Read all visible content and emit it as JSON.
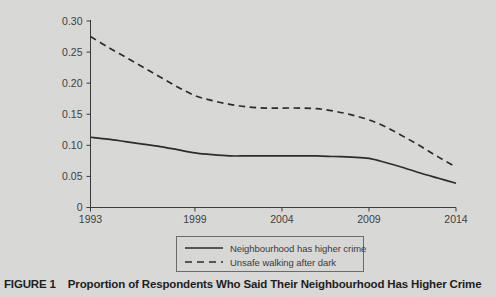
{
  "caption": {
    "figure_number": "FIGURE 1",
    "title": "Proportion of Respondents Who Said Their Neighbourhood Has Higher Crime"
  },
  "legend": {
    "position": "bottom-center",
    "items": [
      {
        "label": "Neighbourhood has higher crime",
        "style": "solid",
        "color": "#2b2b2b"
      },
      {
        "label": "Unsafe walking after dark",
        "style": "dashed",
        "color": "#2b2b2b"
      }
    ]
  },
  "axes": {
    "y_ticks": [
      "0",
      "0.05",
      "0.10",
      "0.15",
      "0.20",
      "0.25",
      "0.30"
    ],
    "x_ticks": [
      "1993",
      "1999",
      "2004",
      "2009",
      "2014"
    ]
  },
  "chart_data": {
    "type": "line",
    "title": "Proportion of Respondents Who Said Their Neighbourhood Has Higher Crime",
    "xlabel": "",
    "ylabel": "",
    "xlim": [
      1993,
      2014
    ],
    "ylim": [
      0,
      0.3
    ],
    "grid": false,
    "legend_position": "bottom-center",
    "x_tick_values": [
      1993,
      1999,
      2004,
      2009,
      2014
    ],
    "y_tick_values": [
      0,
      0.05,
      0.1,
      0.15,
      0.2,
      0.25,
      0.3
    ],
    "y_tick_labels": [
      "0",
      "0.05",
      "0.10",
      "0.15",
      "0.20",
      "0.25",
      "0.30"
    ],
    "x": [
      1993,
      1994,
      1995,
      1996,
      1997,
      1998,
      1999,
      2000,
      2001,
      2002,
      2003,
      2004,
      2005,
      2006,
      2007,
      2008,
      2009,
      2010,
      2011,
      2012,
      2013,
      2014
    ],
    "series": [
      {
        "name": "Neighbourhood has higher crime",
        "style": "solid",
        "color": "#2b2b2b",
        "values": [
          0.113,
          0.11,
          0.106,
          0.102,
          0.098,
          0.093,
          0.088,
          0.085,
          0.083,
          0.083,
          0.083,
          0.083,
          0.083,
          0.083,
          0.082,
          0.081,
          0.079,
          0.072,
          0.064,
          0.055,
          0.047,
          0.039
        ]
      },
      {
        "name": "Unsafe walking after dark",
        "style": "dashed",
        "color": "#2b2b2b",
        "values": [
          0.275,
          0.258,
          0.242,
          0.226,
          0.21,
          0.194,
          0.18,
          0.172,
          0.166,
          0.162,
          0.16,
          0.16,
          0.16,
          0.159,
          0.155,
          0.149,
          0.141,
          0.129,
          0.114,
          0.098,
          0.081,
          0.065
        ]
      }
    ]
  }
}
